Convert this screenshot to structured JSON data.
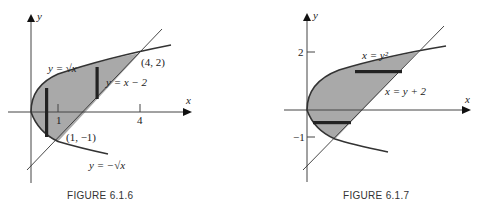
{
  "figures": [
    {
      "caption": "FIGURE 6.1.6",
      "axes": {
        "x_label": "x",
        "y_label": "y",
        "x_ticks": [
          "1",
          "4"
        ]
      },
      "labels": {
        "upper_curve": "y = √x",
        "line": "y = x − 2",
        "lower_curve": "y = −√x",
        "point_upper": "(4, 2)",
        "point_lower": "(1, −1)"
      },
      "strips": "vertical"
    },
    {
      "caption": "FIGURE 6.1.7",
      "axes": {
        "x_label": "x",
        "y_label": "y",
        "y_ticks": [
          "2",
          "−1"
        ]
      },
      "labels": {
        "curve": "x = y²",
        "line": "x = y + 2"
      },
      "strips": "horizontal"
    }
  ],
  "colors": {
    "shade": "#a9a9a9",
    "curve": "#333333",
    "axis": "#444444",
    "strip": "#222222"
  }
}
